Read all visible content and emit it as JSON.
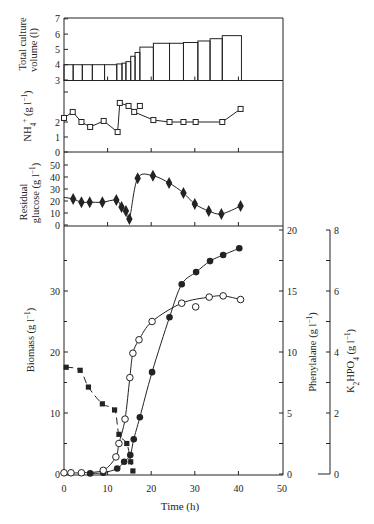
{
  "style": {
    "ink": "#232323",
    "background": "#ffffff"
  },
  "chart_data": [
    {
      "id": "volume",
      "type": "bar",
      "title": "",
      "ylabel_lines": [
        "Total culture",
        "volume (l)"
      ],
      "xlabel": "",
      "xlim": [
        0,
        50
      ],
      "xticks": [
        10,
        20,
        30,
        40
      ],
      "ylim": [
        3,
        7
      ],
      "yticks": [
        3,
        4,
        5,
        6,
        7
      ],
      "grid": false,
      "bin_edges": [
        0,
        2.1,
        4.2,
        6.5,
        9.3,
        12.1,
        13.3,
        14.2,
        15.3,
        16.3,
        17.4,
        20.5,
        24.2,
        27.4,
        30.7,
        33.5,
        36.3,
        40.7
      ],
      "values": [
        4.0,
        4.0,
        4.0,
        4.0,
        4.0,
        4.05,
        4.1,
        4.2,
        4.55,
        4.8,
        5.15,
        5.4,
        5.4,
        5.45,
        5.55,
        5.7,
        5.9
      ]
    },
    {
      "id": "nh4",
      "type": "line",
      "ylabel": "NH_{4}^{+} (g l^{−1})",
      "xlim": [
        0,
        50
      ],
      "xticks": [
        10,
        20,
        30,
        40
      ],
      "ylim": [
        0,
        4.7
      ],
      "yticks": [
        0,
        1,
        2
      ],
      "yminor": [
        4
      ],
      "grid": false,
      "series": [
        {
          "name": "NH4+",
          "marker": "open-square",
          "line": "solid",
          "smooth": false,
          "points": [
            [
              0,
              2.27
            ],
            [
              2,
              2.67
            ],
            [
              4,
              2.0
            ],
            [
              6,
              1.67
            ],
            [
              9.1,
              2.07
            ],
            [
              12.3,
              1.33
            ],
            [
              12.8,
              3.27
            ],
            [
              14.8,
              3.07
            ],
            [
              16.1,
              2.67
            ],
            [
              20.5,
              2.13
            ],
            [
              24.2,
              2.0
            ],
            [
              27.4,
              2.0
            ],
            [
              30.2,
              2.0
            ],
            [
              36.3,
              2.0
            ],
            [
              40.5,
              2.87
            ]
          ]
        },
        {
          "name": "NH4+ (unconnected point)",
          "marker": "open-square",
          "line": "none",
          "smooth": false,
          "points": [
            [
              17.4,
              3.07
            ]
          ]
        }
      ]
    },
    {
      "id": "glucose",
      "type": "line",
      "ylabel_lines": [
        "Residual",
        "glucose (g l^{−1})"
      ],
      "xlim": [
        0,
        50
      ],
      "xticks": [
        10,
        20,
        30,
        40
      ],
      "ylim": [
        0,
        60
      ],
      "yticks": [
        0,
        10,
        20,
        30,
        40,
        50
      ],
      "grid": false,
      "series": [
        {
          "name": "Residual glucose",
          "marker": "filled-diamond",
          "line": "solid",
          "smooth": true,
          "points": [
            [
              2.1,
              21.7
            ],
            [
              4,
              19
            ],
            [
              5.9,
              19
            ],
            [
              8.8,
              19
            ],
            [
              12,
              20.8
            ],
            [
              13.2,
              15
            ],
            [
              14.2,
              11.7
            ],
            [
              15,
              5
            ],
            [
              16.9,
              39
            ],
            [
              20.4,
              41
            ],
            [
              24.1,
              35
            ],
            [
              27.4,
              26.7
            ],
            [
              30,
              17.5
            ],
            [
              33.2,
              11.7
            ],
            [
              36.1,
              9.2
            ],
            [
              40.5,
              15.8
            ]
          ],
          "line_start": [
            0,
            23
          ]
        }
      ]
    },
    {
      "id": "main",
      "type": "line",
      "xlabel": "Time (h)",
      "xlim": [
        0,
        50
      ],
      "xticks": [
        0,
        10,
        20,
        30,
        40,
        50
      ],
      "grid": false,
      "axes": {
        "left": {
          "label": "Biomass (g l^{−1})",
          "ylim": [
            0,
            40
          ],
          "ticks": [
            0,
            10,
            20,
            30
          ],
          "minor": [
            5,
            15,
            25,
            35
          ]
        },
        "right": {
          "label": "Phenylalane (g l^{−1})",
          "ylim": [
            0,
            20
          ],
          "ticks": [
            0,
            5,
            10,
            15,
            20
          ],
          "minor": [
            2.5,
            7.5,
            12.5,
            17.5
          ]
        },
        "right2": {
          "label": "K_{2}HPO_{4} (g l^{−1})",
          "ylim": [
            0,
            8
          ],
          "ticks": [
            0,
            2,
            4,
            6,
            8
          ],
          "minor": [
            1,
            3,
            5,
            7
          ]
        }
      },
      "series": [
        {
          "name": "Biomass",
          "axis": "left",
          "marker": "filled-circle",
          "line": "solid",
          "smooth": true,
          "points": [
            [
              6,
              0.1
            ],
            [
              9,
              0.2
            ],
            [
              12.2,
              0.9
            ],
            [
              13.8,
              2.0
            ],
            [
              15.2,
              3.1
            ],
            [
              16,
              5.7
            ],
            [
              17.4,
              9.3
            ],
            [
              20.2,
              16.7
            ],
            [
              24.2,
              25.7
            ],
            [
              27,
              31.1
            ],
            [
              30.3,
              33.1
            ],
            [
              33.5,
              34.9
            ],
            [
              36.5,
              35.9
            ],
            [
              40.2,
              37.0
            ]
          ]
        },
        {
          "name": "Phenylalane",
          "axis": "right",
          "marker": "open-circle",
          "line": "solid",
          "smooth": true,
          "points": [
            [
              0,
              0.1
            ],
            [
              1.6,
              0.1
            ],
            [
              4,
              0.1
            ],
            [
              9,
              0.3
            ],
            [
              11.9,
              1.4
            ],
            [
              12.6,
              2.5
            ],
            [
              14,
              4.5
            ],
            [
              15.1,
              7.9
            ],
            [
              15.8,
              9.9
            ],
            [
              17.2,
              11.0
            ],
            [
              20.2,
              12.5
            ],
            [
              27,
              14.0
            ],
            [
              33.3,
              14.5
            ],
            [
              36.5,
              14.6
            ],
            [
              40.5,
              14.3
            ]
          ]
        },
        {
          "name": "Phenylalane (off-curve point)",
          "axis": "right",
          "marker": "open-circle",
          "line": "none",
          "smooth": false,
          "points": [
            [
              30.2,
              13.7
            ]
          ]
        },
        {
          "name": "K2HPO4",
          "axis": "right2",
          "marker": "filled-square",
          "line": "dashed",
          "smooth": true,
          "points": [
            [
              0.5,
              3.5
            ],
            [
              3.7,
              3.4
            ],
            [
              5.6,
              2.85
            ],
            [
              8.8,
              2.3
            ],
            [
              11.6,
              2.1
            ],
            [
              12.6,
              1.3
            ],
            [
              14.4,
              1.0
            ],
            [
              15.3,
              0.4
            ],
            [
              15.8,
              0.1
            ]
          ]
        }
      ]
    }
  ]
}
